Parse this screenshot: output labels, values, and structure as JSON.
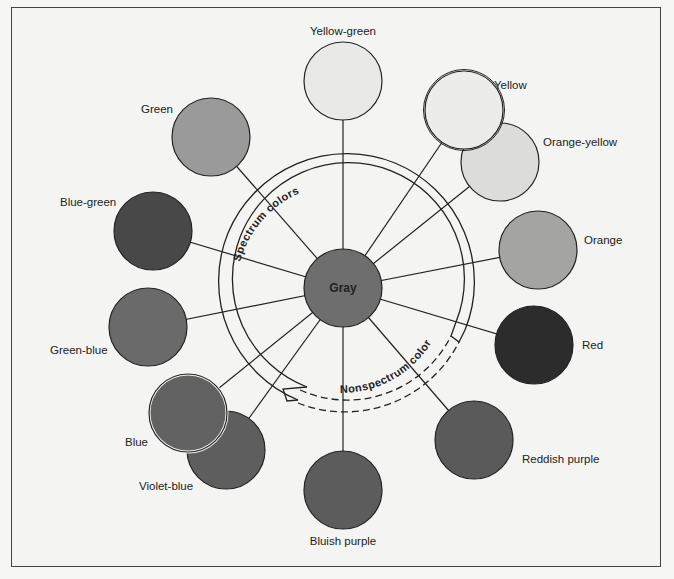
{
  "diagram": {
    "type": "color-circle",
    "center": {
      "label": "Gray",
      "color": "#6e6e6e"
    },
    "ring_labels": {
      "spectrum": "Spectrum colors",
      "nonspectrum": "Nonspectrum colors"
    },
    "nodes": [
      {
        "id": "yellow-green",
        "label": "Yellow-green",
        "color": "#e9e9e7"
      },
      {
        "id": "yellow",
        "label": "Yellow",
        "color": "#ececea"
      },
      {
        "id": "orange-yellow",
        "label": "Orange-yellow",
        "color": "#dcdcda"
      },
      {
        "id": "orange",
        "label": "Orange",
        "color": "#a4a4a2"
      },
      {
        "id": "red",
        "label": "Red",
        "color": "#2c2c2c"
      },
      {
        "id": "reddish-purple",
        "label": "Reddish purple",
        "color": "#5a5a5a"
      },
      {
        "id": "bluish-purple",
        "label": "Bluish purple",
        "color": "#5c5c5c"
      },
      {
        "id": "violet-blue",
        "label": "Violet-blue",
        "color": "#5e5e5e"
      },
      {
        "id": "blue",
        "label": "Blue",
        "color": "#626262"
      },
      {
        "id": "green-blue",
        "label": "Green-blue",
        "color": "#6a6a6a"
      },
      {
        "id": "blue-green",
        "label": "Blue-green",
        "color": "#484848"
      },
      {
        "id": "green",
        "label": "Green",
        "color": "#9a9a9a"
      }
    ]
  }
}
